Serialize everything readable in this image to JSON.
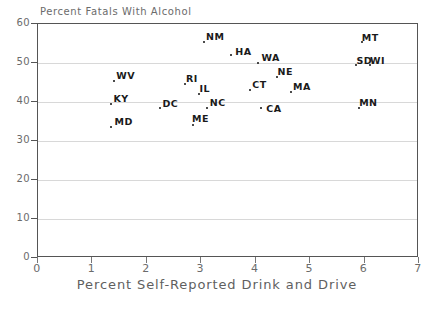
{
  "chart_data": {
    "type": "scatter",
    "title": "Percent Fatals With Alcohol",
    "xlabel": "Percent Self-Reported Drink and Drive",
    "ylabel": "",
    "xlim": [
      0,
      7
    ],
    "ylim": [
      0,
      60
    ],
    "xticks": [
      0,
      1,
      2,
      3,
      4,
      5,
      6,
      7
    ],
    "yticks": [
      0,
      10,
      20,
      30,
      40,
      50,
      60
    ],
    "grid": "horizontal",
    "legend": "none",
    "marker_color": "#111111",
    "gridline_color": "#d8d8d8",
    "axis_color": "#555555",
    "points": [
      {
        "label": "MD",
        "x": 1.35,
        "y": 33.5
      },
      {
        "label": "KY",
        "x": 1.35,
        "y": 39.5
      },
      {
        "label": "WV",
        "x": 1.4,
        "y": 45.5
      },
      {
        "label": "DC",
        "x": 2.25,
        "y": 38.5
      },
      {
        "label": "RI",
        "x": 2.7,
        "y": 44.5
      },
      {
        "label": "ME",
        "x": 2.85,
        "y": 34.0
      },
      {
        "label": "IL",
        "x": 2.95,
        "y": 42.0
      },
      {
        "label": "NM",
        "x": 3.05,
        "y": 55.5
      },
      {
        "label": "NC",
        "x": 3.1,
        "y": 38.5
      },
      {
        "label": "HA",
        "x": 3.55,
        "y": 52.0
      },
      {
        "label": "CT",
        "x": 3.9,
        "y": 43.0
      },
      {
        "label": "WA",
        "x": 4.05,
        "y": 50.0
      },
      {
        "label": "CA",
        "x": 4.1,
        "y": 38.5
      },
      {
        "label": "NE",
        "x": 4.4,
        "y": 46.5
      },
      {
        "label": "MA",
        "x": 4.65,
        "y": 42.5
      },
      {
        "label": "SD",
        "x": 5.85,
        "y": 49.5
      },
      {
        "label": "WI",
        "x": 6.1,
        "y": 49.5
      },
      {
        "label": "MT",
        "x": 5.95,
        "y": 55.5
      },
      {
        "label": "MN",
        "x": 5.9,
        "y": 38.5
      }
    ]
  }
}
